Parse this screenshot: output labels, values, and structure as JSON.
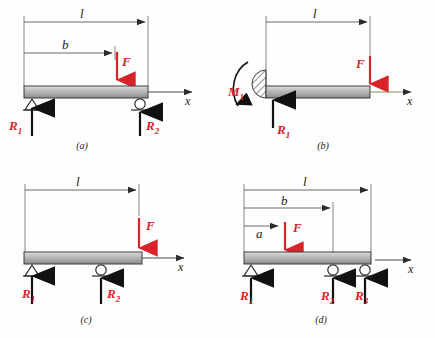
{
  "figure": {
    "background_color": "#fefefe",
    "beam_fill_top": "#d6d6d6",
    "beam_fill_bottom": "#8f8f8f",
    "beam_stroke": "#3a3a3a",
    "force_color": "#d9232a",
    "line_color": "#4a4a4a",
    "reaction_color": "#111111"
  },
  "panels": [
    {
      "id": "a",
      "label": "(a)",
      "description": "simply-supported-beam-with-intermediate-load",
      "dimensions": [
        {
          "name": "l",
          "label": "l"
        },
        {
          "name": "b",
          "label": "b"
        }
      ],
      "loads": [
        {
          "name": "F",
          "label": "F",
          "direction": "down"
        }
      ],
      "reactions": [
        {
          "name": "R1",
          "label": "R",
          "sub": "1"
        },
        {
          "name": "R2",
          "label": "R",
          "sub": "2"
        }
      ],
      "supports": [
        {
          "type": "pin"
        },
        {
          "type": "roller"
        }
      ],
      "axis": {
        "label": "x"
      }
    },
    {
      "id": "b",
      "label": "(b)",
      "description": "cantilever-beam-with-end-load",
      "dimensions": [
        {
          "name": "l",
          "label": "l"
        }
      ],
      "loads": [
        {
          "name": "F",
          "label": "F",
          "direction": "down"
        }
      ],
      "reactions": [
        {
          "name": "R1",
          "label": "R",
          "sub": "1"
        },
        {
          "name": "M1",
          "label": "M",
          "sub": "1"
        }
      ],
      "supports": [
        {
          "type": "fixed-wall"
        }
      ],
      "axis": {
        "label": "x"
      }
    },
    {
      "id": "c",
      "label": "(c)",
      "description": "overhanging-beam-with-end-load",
      "dimensions": [
        {
          "name": "l",
          "label": "l"
        }
      ],
      "loads": [
        {
          "name": "F",
          "label": "F",
          "direction": "down"
        }
      ],
      "reactions": [
        {
          "name": "R1",
          "label": "R",
          "sub": "1"
        },
        {
          "name": "R2",
          "label": "R",
          "sub": "2"
        }
      ],
      "supports": [
        {
          "type": "pin"
        },
        {
          "type": "roller"
        }
      ],
      "axis": {
        "label": "x"
      }
    },
    {
      "id": "d",
      "label": "(d)",
      "description": "continuous-beam-three-supports",
      "dimensions": [
        {
          "name": "l",
          "label": "l"
        },
        {
          "name": "b",
          "label": "b"
        },
        {
          "name": "a",
          "label": "a"
        }
      ],
      "loads": [
        {
          "name": "F",
          "label": "F",
          "direction": "down"
        }
      ],
      "reactions": [
        {
          "name": "R1",
          "label": "R",
          "sub": "1"
        },
        {
          "name": "R2",
          "label": "R",
          "sub": "2"
        },
        {
          "name": "R3",
          "label": "R",
          "sub": "3"
        }
      ],
      "supports": [
        {
          "type": "pin"
        },
        {
          "type": "roller"
        },
        {
          "type": "roller"
        }
      ],
      "axis": {
        "label": "x"
      }
    }
  ]
}
